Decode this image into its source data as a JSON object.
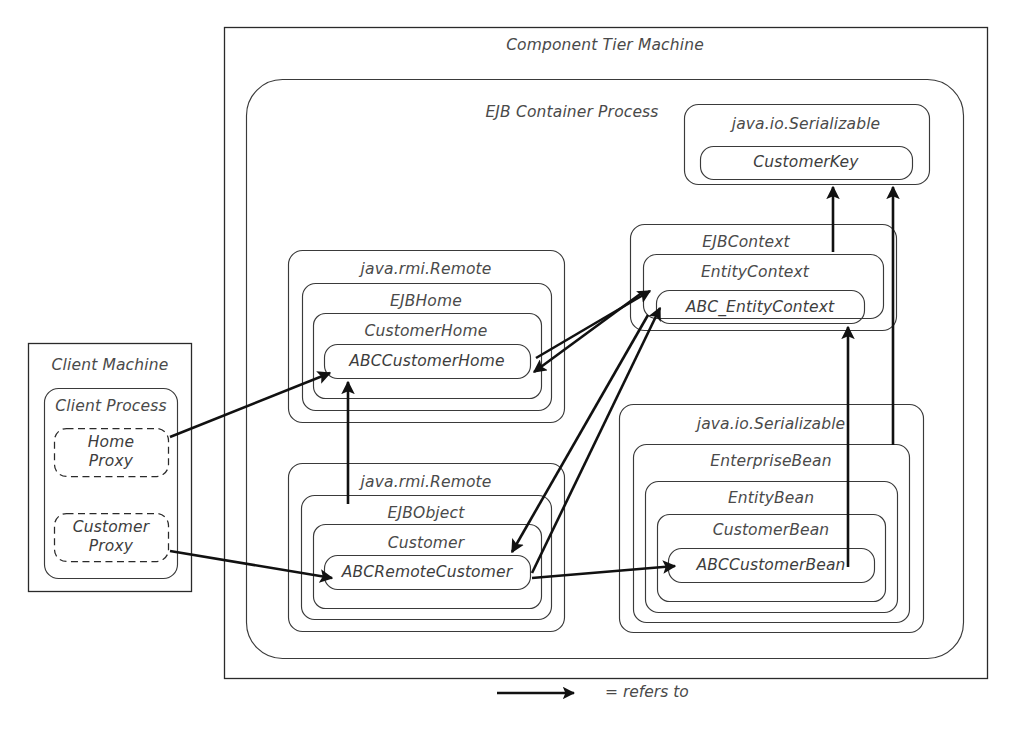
{
  "diagram": {
    "title": "Component Tier Machine",
    "container_label": "EJB Container Process",
    "client_machine": "Client Machine",
    "client_process": "Client Process",
    "proxies": [
      {
        "name": "home-proxy",
        "line1": "Home",
        "line2": "Proxy"
      },
      {
        "name": "customer-proxy",
        "line1": "Customer",
        "line2": "Proxy"
      }
    ],
    "groups": {
      "serializable_key": {
        "outer": "java.io.Serializable",
        "leaf": "CustomerKey"
      },
      "home_group": {
        "l1": "java.rmi.Remote",
        "l2": "EJBHome",
        "l3": "CustomerHome",
        "leaf": "ABCCustomerHome"
      },
      "context_group": {
        "l1": "EJBContext",
        "l2": "EntityContext",
        "leaf": "ABC_EntityContext"
      },
      "object_group": {
        "l1": "java.rmi.Remote",
        "l2": "EJBObject",
        "l3": "Customer",
        "leaf": "ABCRemoteCustomer"
      },
      "bean_group": {
        "l1": "java.io.Serializable",
        "l2": "EnterpriseBean",
        "l3": "EntityBean",
        "l4": "CustomerBean",
        "leaf": "ABCCustomerBean"
      }
    },
    "legend": {
      "arrow_name": "refers-to-arrow",
      "text": "= refers to"
    },
    "colors": {
      "stroke": "#3a3a3a",
      "arrow": "#111111",
      "text": "#4a4a4a",
      "background": "#ffffff"
    }
  }
}
